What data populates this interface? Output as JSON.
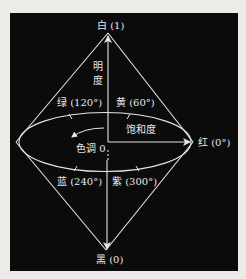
{
  "diagram": {
    "type": "HSI color double-cone model",
    "colors": {
      "background": "#ecebe8",
      "panel": "#0b0b0b",
      "stroke": "#e6e6e6",
      "text": "#e8e8e8"
    },
    "labels": {
      "top": "白 (1)",
      "bottom": "黑 (0)",
      "axis_char1": "明",
      "axis_char2": "度",
      "green": "绿 (120°)",
      "yellow": "黄 (60°)",
      "red": "红 (0°)",
      "blue": "蓝 (240°)",
      "purple": "紫 (300°)",
      "saturation": "饱和度",
      "hue": "色调 0"
    }
  }
}
